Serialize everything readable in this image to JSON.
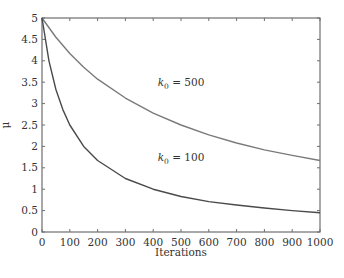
{
  "chart_data": {
    "type": "line",
    "title": "",
    "xlabel": "Iterations",
    "ylabel": "μ",
    "xlim": [
      0,
      1000
    ],
    "ylim": [
      0,
      5
    ],
    "xticks": [
      0,
      100,
      200,
      300,
      400,
      500,
      600,
      700,
      800,
      900,
      1000
    ],
    "yticks": [
      0,
      0.5,
      1,
      1.5,
      2,
      2.5,
      3,
      3.5,
      4,
      4.5,
      5
    ],
    "xtick_labels": [
      "0",
      "100",
      "200",
      "300",
      "400",
      "500",
      "600",
      "700",
      "800",
      "900",
      "1000"
    ],
    "ytick_labels": [
      "0",
      "0.5",
      "1",
      "1.5",
      "2",
      "2.5",
      "3",
      "3.5",
      "4",
      "4.5",
      "5"
    ],
    "grid": false,
    "legend": null,
    "series": [
      {
        "name": "k0 = 500",
        "label_main": "k",
        "label_sub": "0",
        "label_rest": " = 500",
        "color": "#7a7a7a",
        "annotation_xy": [
          500,
          3.4
        ],
        "x": [
          0,
          50,
          100,
          150,
          200,
          300,
          400,
          500,
          600,
          700,
          800,
          900,
          1000
        ],
        "values": [
          5.0,
          4.55,
          4.17,
          3.85,
          3.57,
          3.13,
          2.78,
          2.5,
          2.27,
          2.08,
          1.92,
          1.79,
          1.67
        ]
      },
      {
        "name": "k0 = 100",
        "label_main": "k",
        "label_sub": "0",
        "label_rest": " = 100",
        "color": "#4a4a4a",
        "annotation_xy": [
          500,
          1.65
        ],
        "x": [
          0,
          25,
          50,
          75,
          100,
          150,
          200,
          300,
          400,
          500,
          600,
          700,
          800,
          900,
          1000
        ],
        "values": [
          5.0,
          4.0,
          3.33,
          2.86,
          2.5,
          2.0,
          1.67,
          1.25,
          1.0,
          0.83,
          0.71,
          0.63,
          0.56,
          0.5,
          0.45
        ]
      }
    ]
  }
}
